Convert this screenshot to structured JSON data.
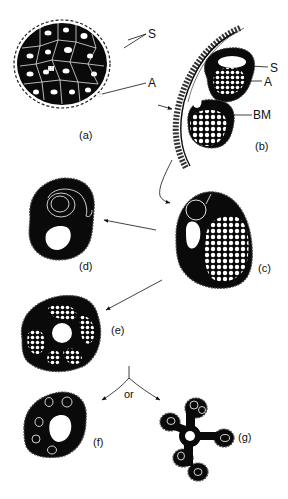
{
  "figure": {
    "panels": [
      {
        "id": "a",
        "label": "(a)",
        "description": "cross-section of nerve bundle with many Schwann cells"
      },
      {
        "id": "b",
        "label": "(b)",
        "description": "Schwann cells enclosing axon bundles inside basement membrane"
      },
      {
        "id": "c",
        "label": "(c)",
        "description": "Schwann cell with nucleus, vacuole and many axons"
      },
      {
        "id": "d",
        "label": "(d)",
        "description": "Schwann cell with concentric membrane wrapping"
      },
      {
        "id": "e",
        "label": "(e)",
        "description": "cell with central lumen surrounded by axon clusters"
      },
      {
        "id": "f",
        "label": "(f)",
        "description": "cell with central lumen and several single axons"
      },
      {
        "id": "g",
        "label": "(g)",
        "description": "star-shaped cell with lobes containing axons"
      }
    ],
    "annotations": {
      "a_S": "S",
      "a_A": "A",
      "b_S": "S",
      "b_A": "A",
      "b_BM": "BM",
      "or": "or"
    },
    "colors": {
      "ink": "#0a0a0a",
      "paper": "#ffffff"
    }
  }
}
